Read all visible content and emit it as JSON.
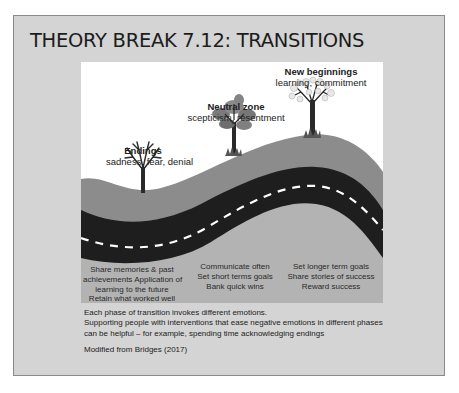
{
  "slide": {
    "title": "THEORY BREAK 7.12: TRANSITIONS"
  },
  "diagram": {
    "phases": [
      {
        "name": "Endings",
        "emotions": "sadness, fear, denial",
        "icon": "bare-tree-icon",
        "actions": [
          "Share memories & past",
          "achievements Application of",
          "learning to the future",
          "Retain what worked well"
        ]
      },
      {
        "name": "Neutral zone",
        "emotions": "scepticism, resentment",
        "icon": "leafy-tree-icon",
        "actions": [
          "Communicate often",
          "Set short terms goals",
          "Bank quick wins"
        ]
      },
      {
        "name": "New beginnings",
        "emotions": "learning, commitment",
        "icon": "blossom-tree-icon",
        "actions": [
          "Set longer term goals",
          "Share stories of success",
          "Reward success"
        ]
      }
    ],
    "colors": {
      "hill": "#8c8c8c",
      "road": "#1e1e1e",
      "road_marking": "#ffffff",
      "lower_ground": "#b3b3b3",
      "sky": "#ffffff",
      "slide_bg": "#d4d4d4"
    }
  },
  "caption": {
    "lines": [
      "Each phase of transition invokes different emotions.",
      "Supporting people with interventions that ease negative emotions in different phases",
      "can be helpful – for example, spending time acknowledging endings"
    ],
    "source": "Modified from Bridges (2017)"
  }
}
